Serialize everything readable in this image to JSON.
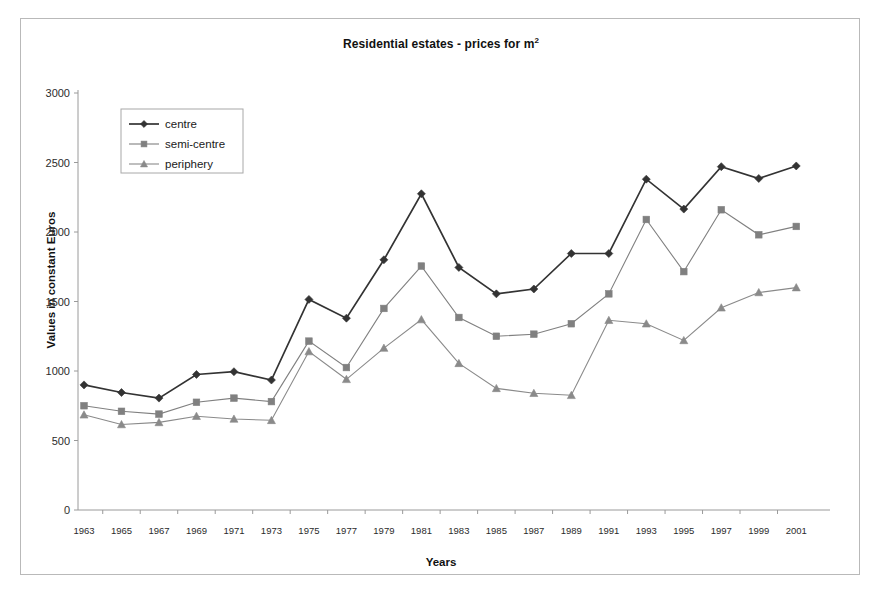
{
  "chart_data": {
    "type": "line",
    "title": "Residential estates - prices for m2",
    "title_main": "Residential estates - prices for m",
    "title_sup": "2",
    "xlabel": "Years",
    "ylabel": "Values in constant Euros",
    "grid": false,
    "legend_position": "top-left inside plot",
    "ylim": [
      0,
      3000
    ],
    "yticks": [
      0,
      500,
      1000,
      1500,
      2000,
      2500,
      3000
    ],
    "ytick_labels": [
      "0",
      "500",
      "1000",
      "1500",
      "2000",
      "2500",
      "3000"
    ],
    "categories": [
      1963,
      1965,
      1967,
      1969,
      1971,
      1973,
      1975,
      1977,
      1979,
      1981,
      1983,
      1985,
      1987,
      1989,
      1991,
      1993,
      1995,
      1997,
      1999,
      2001
    ],
    "xtick_labels": [
      "1963",
      "1965",
      "1967",
      "1969",
      "1971",
      "1973",
      "1975",
      "1977",
      "1979",
      "1981",
      "1983",
      "1985",
      "1987",
      "1989",
      "1991",
      "1993",
      "1995",
      "1997",
      "1999",
      "2001"
    ],
    "series": [
      {
        "name": "centre",
        "marker": "diamond",
        "color": "#333333",
        "values": [
          900,
          845,
          805,
          975,
          995,
          935,
          1515,
          1380,
          1800,
          2275,
          1745,
          1555,
          1590,
          1845,
          1845,
          2380,
          2165,
          2470,
          2385,
          2475
        ]
      },
      {
        "name": "semi-centre",
        "marker": "square",
        "color": "#808080",
        "values": [
          750,
          710,
          690,
          775,
          805,
          780,
          1215,
          1025,
          1450,
          1755,
          1385,
          1250,
          1265,
          1340,
          1555,
          2090,
          1715,
          2160,
          1980,
          2040
        ]
      },
      {
        "name": "periphery",
        "marker": "triangle",
        "color": "#8a8a8a",
        "values": [
          685,
          615,
          630,
          675,
          655,
          645,
          1140,
          940,
          1165,
          1370,
          1055,
          875,
          840,
          825,
          1365,
          1340,
          1220,
          1455,
          1565,
          1600
        ]
      }
    ]
  },
  "legend": {
    "items": [
      {
        "label": "centre"
      },
      {
        "label": "semi-centre"
      },
      {
        "label": "periphery"
      }
    ]
  }
}
